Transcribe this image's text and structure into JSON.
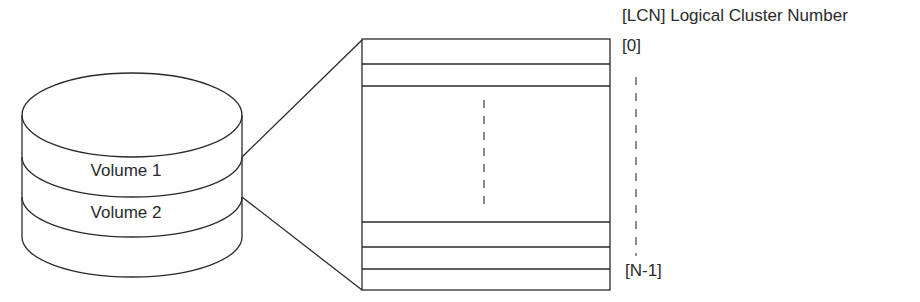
{
  "diagram": {
    "volumes": [
      {
        "label": "Volume 1"
      },
      {
        "label": "Volume 2"
      }
    ],
    "cluster_table": {
      "header_label": "[LCN] Logical Cluster Number",
      "first_index_label": "[0]",
      "last_index_label": "[N-1]"
    },
    "colors": {
      "stroke": "#2a2a2a",
      "background": "#ffffff"
    }
  }
}
